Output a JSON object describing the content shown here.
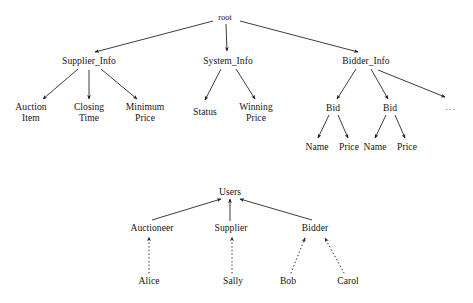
{
  "figure": {
    "title": "",
    "background_color": "#ffffff",
    "line_color": "#1a1a1a",
    "text_color": "#151515"
  },
  "diagrams": [
    {
      "id": "auction-data-tree",
      "type": "tree",
      "edge_style": "solid",
      "edge_direction": "parent-to-child",
      "root": "root",
      "nodes": [
        {
          "id": "root",
          "label": "root",
          "x": 225,
          "y": 18,
          "size": "small"
        },
        {
          "id": "supplier_info",
          "label": "Supplier_Info",
          "x": 89,
          "y": 61
        },
        {
          "id": "system_info",
          "label": "System_Info",
          "x": 228,
          "y": 61
        },
        {
          "id": "bidder_info",
          "label": "Bidder_Info",
          "x": 366,
          "y": 61
        },
        {
          "id": "auction_item",
          "label": "Auction\nItem",
          "x": 31,
          "y": 112
        },
        {
          "id": "closing_time",
          "label": "Closing\nTime",
          "x": 89,
          "y": 112
        },
        {
          "id": "minimum_price",
          "label": "Minimum\nPrice",
          "x": 145,
          "y": 112
        },
        {
          "id": "status",
          "label": "Status",
          "x": 205,
          "y": 112
        },
        {
          "id": "winning_price",
          "label": "Winning\nPrice",
          "x": 256,
          "y": 112
        },
        {
          "id": "bid1",
          "label": "Bid",
          "x": 333,
          "y": 108
        },
        {
          "id": "bid2",
          "label": "Bid",
          "x": 390,
          "y": 108
        },
        {
          "id": "more",
          "label": "...",
          "x": 451,
          "y": 107,
          "kind": "ellipsis"
        },
        {
          "id": "name1",
          "label": "Name",
          "x": 317,
          "y": 147
        },
        {
          "id": "price1",
          "label": "Price",
          "x": 349,
          "y": 147
        },
        {
          "id": "name2",
          "label": "Name",
          "x": 375,
          "y": 147
        },
        {
          "id": "price2",
          "label": "Price",
          "x": 407,
          "y": 147
        }
      ],
      "edges": [
        {
          "from": "root",
          "to": "supplier_info"
        },
        {
          "from": "root",
          "to": "system_info"
        },
        {
          "from": "root",
          "to": "bidder_info"
        },
        {
          "from": "supplier_info",
          "to": "auction_item"
        },
        {
          "from": "supplier_info",
          "to": "closing_time"
        },
        {
          "from": "supplier_info",
          "to": "minimum_price"
        },
        {
          "from": "system_info",
          "to": "status"
        },
        {
          "from": "system_info",
          "to": "winning_price"
        },
        {
          "from": "bidder_info",
          "to": "bid1"
        },
        {
          "from": "bidder_info",
          "to": "bid2"
        },
        {
          "from": "bidder_info",
          "to": "more"
        },
        {
          "from": "bid1",
          "to": "name1"
        },
        {
          "from": "bid1",
          "to": "price1"
        },
        {
          "from": "bid2",
          "to": "name2"
        },
        {
          "from": "bid2",
          "to": "price2"
        }
      ]
    },
    {
      "id": "users-hierarchy",
      "type": "tree",
      "edge_style": "mixed",
      "edge_direction": "child-to-parent",
      "root": "users",
      "nodes": [
        {
          "id": "users",
          "label": "Users",
          "x": 230,
          "y": 192
        },
        {
          "id": "auctioneer",
          "label": "Auctioneer",
          "x": 152,
          "y": 228
        },
        {
          "id": "supplier",
          "label": "Supplier",
          "x": 231,
          "y": 228
        },
        {
          "id": "bidder",
          "label": "Bidder",
          "x": 315,
          "y": 228
        },
        {
          "id": "alice",
          "label": "Alice",
          "x": 149,
          "y": 281
        },
        {
          "id": "sally",
          "label": "Sally",
          "x": 233,
          "y": 281
        },
        {
          "id": "bob",
          "label": "Bob",
          "x": 288,
          "y": 281
        },
        {
          "id": "carol",
          "label": "Carol",
          "x": 348,
          "y": 281
        }
      ],
      "edges": [
        {
          "from": "auctioneer",
          "to": "users",
          "style": "solid"
        },
        {
          "from": "supplier",
          "to": "users",
          "style": "solid"
        },
        {
          "from": "bidder",
          "to": "users",
          "style": "solid"
        },
        {
          "from": "alice",
          "to": "auctioneer",
          "style": "dotted"
        },
        {
          "from": "sally",
          "to": "supplier",
          "style": "dotted"
        },
        {
          "from": "bob",
          "to": "bidder",
          "style": "dotted"
        },
        {
          "from": "carol",
          "to": "bidder",
          "style": "dotted"
        }
      ]
    }
  ]
}
